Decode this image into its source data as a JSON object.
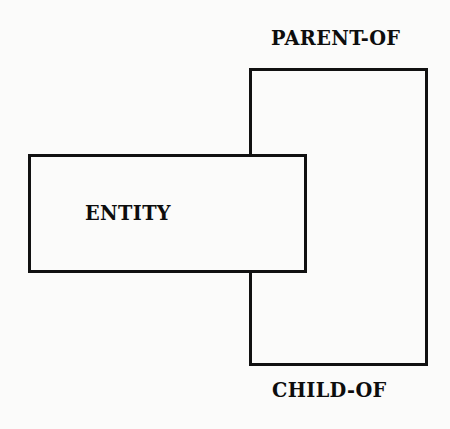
{
  "diagram": {
    "type": "entity-relationship-overlap-diagram",
    "background_color": "#fbfbfa",
    "line_color": "#111111",
    "text_color": "#0d0d0d",
    "entity_box": {
      "label": "ENTITY",
      "x": 28,
      "y": 154,
      "width": 279,
      "height": 119
    },
    "relationship_box": {
      "top_label": "PARENT-OF",
      "bottom_label": "CHILD-OF",
      "x": 249,
      "y": 68,
      "width": 179,
      "height": 298
    },
    "labels": {
      "parent_of": "PARENT-OF",
      "entity": "ENTITY",
      "child_of": "CHILD-OF"
    }
  }
}
